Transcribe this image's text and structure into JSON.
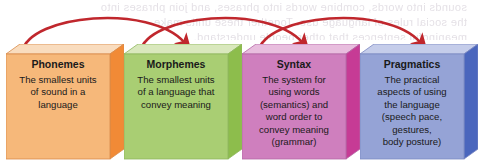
{
  "diagram": {
    "background_color": "#ffffff",
    "arrow_color": "#c0272d",
    "bleed_through_lines": [
      "sounds into words, combine words into phrases, and join phrases into",
      "the social rules of language use. Together these units make",
      "meaningful sentences that other people understand."
    ],
    "arrows": [
      {
        "name": "arrow-phonemes-to-morphemes",
        "from": "Phonemes",
        "to": "Morphemes"
      },
      {
        "name": "arrow-morphemes-to-syntax",
        "from": "Morphemes",
        "to": "Syntax"
      },
      {
        "name": "arrow-syntax-to-pragmatics",
        "from": "Syntax",
        "to": "Pragmatics"
      }
    ],
    "boxes": [
      {
        "id": "phonemes",
        "title": "Phonemes",
        "body": "The smallest units\nof sound in a\nlanguage",
        "face_color": "#f6b87a",
        "top_color": "#f9dcbe",
        "side_color": "#f18a36",
        "edge_color": "#d98b4a"
      },
      {
        "id": "morphemes",
        "title": "Morphemes",
        "body": "The smallest units\nof a language that\nconvey meaning",
        "face_color": "#a9ce73",
        "top_color": "#d9e8bd",
        "side_color": "#8dbd4c",
        "edge_color": "#8fb75e"
      },
      {
        "id": "syntax",
        "title": "Syntax",
        "body": "The system for\nusing words\n(semantics) and\nword order to\nconvey meaning\n(grammar)",
        "face_color": "#cf7fbe",
        "top_color": "#e8bede",
        "side_color": "#c63b95",
        "edge_color": "#b568a6"
      },
      {
        "id": "pragmatics",
        "title": "Pragmatics",
        "body": "The practical\naspects of using\nthe language\n(speech pace,\ngestures,\nbody posture)",
        "face_color": "#95a3d6",
        "top_color": "#c5cdea",
        "side_color": "#4a66bd",
        "edge_color": "#7b89c2"
      }
    ]
  }
}
